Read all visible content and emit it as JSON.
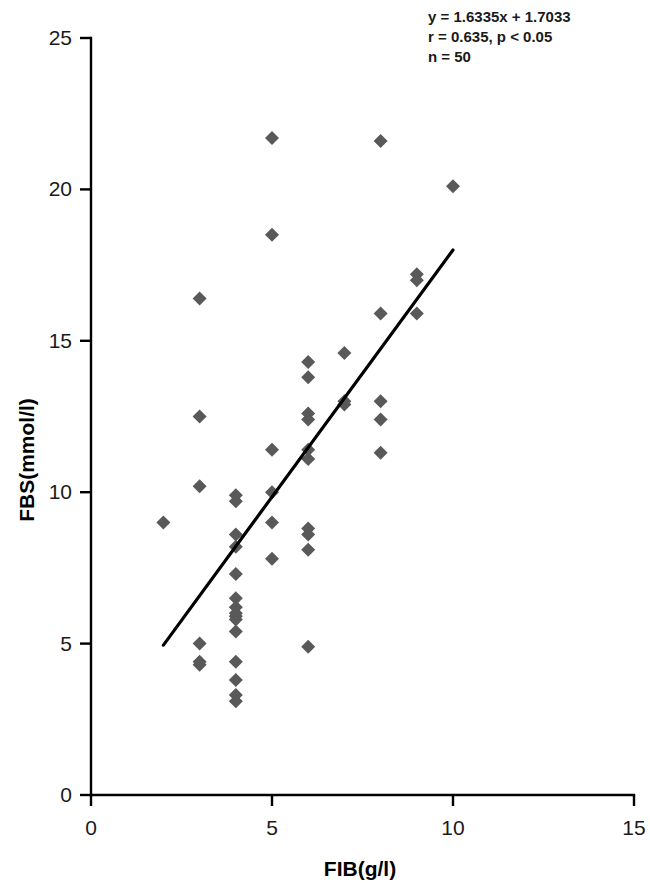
{
  "chart_data": {
    "type": "scatter",
    "title": "",
    "xlabel": "FIB(g/l)",
    "ylabel": "FBS(mmol/l)",
    "xlim": [
      0,
      15
    ],
    "ylim": [
      0,
      25
    ],
    "xticks": [
      0,
      5,
      10,
      15
    ],
    "yticks": [
      0,
      5,
      10,
      15,
      20,
      25
    ],
    "xtick_labels": [
      "0",
      "5",
      "10",
      "15"
    ],
    "ytick_labels": [
      "0",
      "5",
      "10",
      "15",
      "20",
      "25"
    ],
    "grid": false,
    "legend": null,
    "marker": "diamond",
    "marker_color": "#595959",
    "line_color": "#000000",
    "annotations": [
      "y = 1.6335x + 1.7033",
      "r = 0.635,   p < 0.05",
      "n = 50"
    ],
    "regression": {
      "slope": 1.6335,
      "intercept": 1.7033,
      "r": 0.635,
      "p_text": "p < 0.05",
      "n": 50,
      "x_start": 2.0,
      "y_start": 4.95,
      "x_end": 10.0,
      "y_end": 18.0
    },
    "points": [
      {
        "x": 2.0,
        "y": 9.0
      },
      {
        "x": 3.0,
        "y": 16.4
      },
      {
        "x": 3.0,
        "y": 12.5
      },
      {
        "x": 3.0,
        "y": 10.2
      },
      {
        "x": 3.0,
        "y": 5.0
      },
      {
        "x": 3.0,
        "y": 4.4
      },
      {
        "x": 3.0,
        "y": 4.3
      },
      {
        "x": 4.0,
        "y": 9.9
      },
      {
        "x": 4.0,
        "y": 9.7
      },
      {
        "x": 4.0,
        "y": 8.6
      },
      {
        "x": 4.0,
        "y": 8.2
      },
      {
        "x": 4.0,
        "y": 7.3
      },
      {
        "x": 4.0,
        "y": 6.5
      },
      {
        "x": 4.0,
        "y": 6.2
      },
      {
        "x": 4.0,
        "y": 6.0
      },
      {
        "x": 4.0,
        "y": 5.9
      },
      {
        "x": 4.0,
        "y": 5.8
      },
      {
        "x": 4.0,
        "y": 5.4
      },
      {
        "x": 4.0,
        "y": 4.4
      },
      {
        "x": 4.0,
        "y": 3.8
      },
      {
        "x": 4.0,
        "y": 3.3
      },
      {
        "x": 4.0,
        "y": 3.1
      },
      {
        "x": 5.0,
        "y": 21.7
      },
      {
        "x": 5.0,
        "y": 18.5
      },
      {
        "x": 5.0,
        "y": 11.4
      },
      {
        "x": 5.0,
        "y": 10.0
      },
      {
        "x": 5.0,
        "y": 9.0
      },
      {
        "x": 5.0,
        "y": 7.8
      },
      {
        "x": 6.0,
        "y": 14.3
      },
      {
        "x": 6.0,
        "y": 13.8
      },
      {
        "x": 6.0,
        "y": 12.6
      },
      {
        "x": 6.0,
        "y": 12.4
      },
      {
        "x": 6.0,
        "y": 11.4
      },
      {
        "x": 6.0,
        "y": 11.1
      },
      {
        "x": 6.0,
        "y": 8.8
      },
      {
        "x": 6.0,
        "y": 8.6
      },
      {
        "x": 6.0,
        "y": 8.1
      },
      {
        "x": 6.0,
        "y": 4.9
      },
      {
        "x": 7.0,
        "y": 14.6
      },
      {
        "x": 7.0,
        "y": 13.0
      },
      {
        "x": 7.0,
        "y": 12.9
      },
      {
        "x": 8.0,
        "y": 21.6
      },
      {
        "x": 8.0,
        "y": 15.9
      },
      {
        "x": 8.0,
        "y": 13.0
      },
      {
        "x": 8.0,
        "y": 12.4
      },
      {
        "x": 8.0,
        "y": 11.3
      },
      {
        "x": 9.0,
        "y": 17.2
      },
      {
        "x": 9.0,
        "y": 17.0
      },
      {
        "x": 9.0,
        "y": 15.9
      },
      {
        "x": 10.0,
        "y": 20.1
      }
    ]
  }
}
